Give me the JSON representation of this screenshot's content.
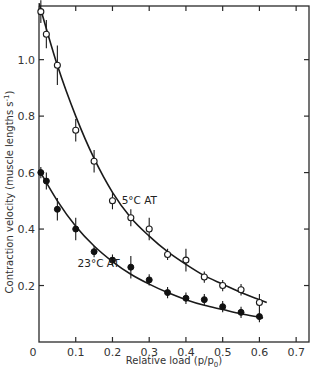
{
  "chart_data": {
    "type": "scatter",
    "title": "",
    "xlabel": "Relative load (p/p",
    "xlabel_sub": "0",
    "xlabel_close": ")",
    "ylabel": "Contraction velocity (muscle lengths s",
    "ylabel_sup": "-1",
    "ylabel_close": ")",
    "xlim": [
      0,
      0.735
    ],
    "ylim": [
      0,
      1.19
    ],
    "grid": false,
    "legend": "none (inline annotations)",
    "x_ticks": [
      {
        "value": 0,
        "label": "0"
      },
      {
        "value": 0.1,
        "label": "0.1"
      },
      {
        "value": 0.2,
        "label": "0.2"
      },
      {
        "value": 0.3,
        "label": "0.3"
      },
      {
        "value": 0.4,
        "label": "0.4"
      },
      {
        "value": 0.5,
        "label": "0.5"
      },
      {
        "value": 0.6,
        "label": "0.6"
      },
      {
        "value": 0.7,
        "label": "0.7"
      }
    ],
    "y_ticks": [
      {
        "value": 0.2,
        "label": "0.2"
      },
      {
        "value": 0.4,
        "label": "0.4"
      },
      {
        "value": 0.6,
        "label": "0.6"
      },
      {
        "value": 0.8,
        "label": "0.8"
      },
      {
        "value": 1.0,
        "label": "1.0"
      }
    ],
    "series": [
      {
        "name": "5°C AT",
        "marker": "open-circle",
        "annotation": {
          "text": "5°C AT",
          "x": 0.225,
          "y": 0.49
        },
        "points": [
          {
            "x": 0.005,
            "y": 1.17,
            "err": 0.04
          },
          {
            "x": 0.02,
            "y": 1.09,
            "err": 0.05
          },
          {
            "x": 0.05,
            "y": 0.98,
            "err": 0.07
          },
          {
            "x": 0.1,
            "y": 0.75,
            "err": 0.04
          },
          {
            "x": 0.15,
            "y": 0.64,
            "err": 0.04
          },
          {
            "x": 0.2,
            "y": 0.5,
            "err": 0.03
          },
          {
            "x": 0.25,
            "y": 0.44,
            "err": 0.03
          },
          {
            "x": 0.3,
            "y": 0.4,
            "err": 0.04
          },
          {
            "x": 0.35,
            "y": 0.31,
            "err": 0.02
          },
          {
            "x": 0.4,
            "y": 0.29,
            "err": 0.04
          },
          {
            "x": 0.45,
            "y": 0.23,
            "err": 0.01
          },
          {
            "x": 0.5,
            "y": 0.2,
            "err": 0.01
          },
          {
            "x": 0.55,
            "y": 0.185,
            "err": 0.01
          },
          {
            "x": 0.6,
            "y": 0.14,
            "err": 0.03
          }
        ],
        "fit_curve": [
          [
            0.0,
            1.2
          ],
          [
            0.05,
            0.98
          ],
          [
            0.1,
            0.8
          ],
          [
            0.15,
            0.65
          ],
          [
            0.2,
            0.53
          ],
          [
            0.25,
            0.44
          ],
          [
            0.3,
            0.375
          ],
          [
            0.35,
            0.32
          ],
          [
            0.4,
            0.275
          ],
          [
            0.45,
            0.235
          ],
          [
            0.5,
            0.205
          ],
          [
            0.55,
            0.175
          ],
          [
            0.6,
            0.15
          ],
          [
            0.62,
            0.14
          ]
        ]
      },
      {
        "name": "23°C AT",
        "marker": "filled-circle",
        "annotation": {
          "text": "23°C AT",
          "x": 0.105,
          "y": 0.265
        },
        "points": [
          {
            "x": 0.005,
            "y": 0.6,
            "err": 0.01
          },
          {
            "x": 0.02,
            "y": 0.57,
            "err": 0.03
          },
          {
            "x": 0.05,
            "y": 0.47,
            "err": 0.04
          },
          {
            "x": 0.1,
            "y": 0.4,
            "err": 0.04
          },
          {
            "x": 0.15,
            "y": 0.32,
            "err": 0.02
          },
          {
            "x": 0.2,
            "y": 0.29,
            "err": 0.02
          },
          {
            "x": 0.25,
            "y": 0.265,
            "err": 0.04
          },
          {
            "x": 0.3,
            "y": 0.22,
            "err": 0.02
          },
          {
            "x": 0.35,
            "y": 0.175,
            "err": 0.015
          },
          {
            "x": 0.4,
            "y": 0.155,
            "err": 0.015
          },
          {
            "x": 0.45,
            "y": 0.15,
            "err": 0.015
          },
          {
            "x": 0.5,
            "y": 0.125,
            "err": 0.015
          },
          {
            "x": 0.55,
            "y": 0.105,
            "err": 0.008
          },
          {
            "x": 0.6,
            "y": 0.09,
            "err": 0.008
          }
        ],
        "fit_curve": [
          [
            0.0,
            0.61
          ],
          [
            0.05,
            0.5
          ],
          [
            0.1,
            0.41
          ],
          [
            0.15,
            0.34
          ],
          [
            0.2,
            0.285
          ],
          [
            0.25,
            0.24
          ],
          [
            0.3,
            0.205
          ],
          [
            0.35,
            0.175
          ],
          [
            0.4,
            0.15
          ],
          [
            0.45,
            0.13
          ],
          [
            0.5,
            0.115
          ],
          [
            0.55,
            0.1
          ],
          [
            0.6,
            0.088
          ],
          [
            0.61,
            0.085
          ]
        ]
      }
    ]
  }
}
